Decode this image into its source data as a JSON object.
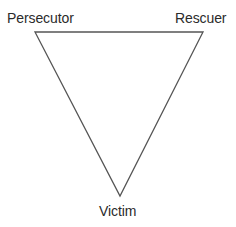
{
  "diagram": {
    "type": "triangle",
    "orientation": "inverted",
    "stroke_color": "#555555",
    "vertices": {
      "top_left": {
        "label": "Persecutor",
        "x": 35,
        "y": 32
      },
      "top_right": {
        "label": "Rescuer",
        "x": 203,
        "y": 32
      },
      "bottom": {
        "label": "Victim",
        "x": 120,
        "y": 196
      }
    }
  },
  "labels": {
    "persecutor": "Persecutor",
    "rescuer": "Rescuer",
    "victim": "Victim"
  }
}
